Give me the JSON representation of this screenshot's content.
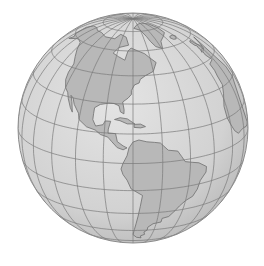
{
  "map": {
    "projection": "orthographic",
    "center": {
      "lon": -75,
      "lat": 18
    },
    "view": {
      "cx": 133,
      "cy": 128,
      "r": 115
    },
    "graticule": {
      "lon_step": 15,
      "lat_step": 15
    },
    "visible_regions": [
      "North America",
      "Central America",
      "Caribbean",
      "South America",
      "Greenland (partial)",
      "Western Europe / Africa edge (partial)"
    ],
    "colors": {
      "background": "#ffffff",
      "ocean": "#d6d6d6",
      "land": "#b8b8b8",
      "coast": "#6e6e6e",
      "graticule": "#7a7a7a",
      "rim": "#8c8c8c"
    }
  }
}
